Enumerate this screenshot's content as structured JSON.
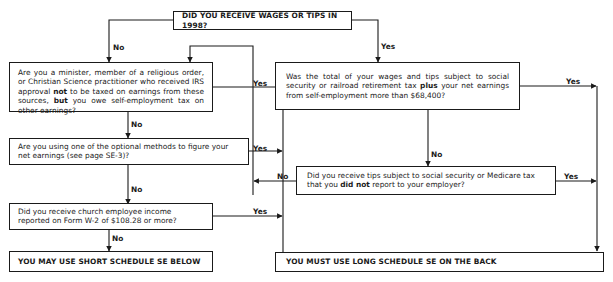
{
  "flowchart": {
    "start": {
      "text": "DID YOU RECEIVE WAGES OR TIPS IN 1998?"
    },
    "q_minister": {
      "parts": [
        {
          "t": "Are you a minister, member of a religious order, or Christian Science practitioner who received IRS approval ",
          "b": false
        },
        {
          "t": "not",
          "b": true
        },
        {
          "t": " to be taxed on earnings from these sources, ",
          "b": false
        },
        {
          "t": "but",
          "b": true
        },
        {
          "t": " you owe self-employment tax on other earnings?",
          "b": false
        }
      ]
    },
    "q_optional": {
      "parts": [
        {
          "t": "Are you using one of the optional methods to figure your net earnings (see page SE-3)?",
          "b": false
        }
      ]
    },
    "q_church": {
      "parts": [
        {
          "t": "Did you receive church employee income reported on Form W-2 of $108.28 or more?",
          "b": false
        }
      ]
    },
    "q_total": {
      "parts": [
        {
          "t": "Was the total of your wages and tips subject to social security or railroad retirement tax ",
          "b": false
        },
        {
          "t": "plus",
          "b": true
        },
        {
          "t": " your net earnings from self-employment more than $68,400?",
          "b": false
        }
      ]
    },
    "q_tips": {
      "parts": [
        {
          "t": "Did you receive tips subject to social security or Medicare tax that you ",
          "b": false
        },
        {
          "t": "did not",
          "b": true
        },
        {
          "t": " report to your employer?",
          "b": false
        }
      ]
    },
    "result_short": {
      "text": "YOU MAY USE SHORT SCHEDULE SE BELOW"
    },
    "result_long": {
      "text": "YOU MUST USE LONG SCHEDULE SE ON THE BACK"
    },
    "labels": {
      "yes": "Yes",
      "no": "No"
    }
  }
}
